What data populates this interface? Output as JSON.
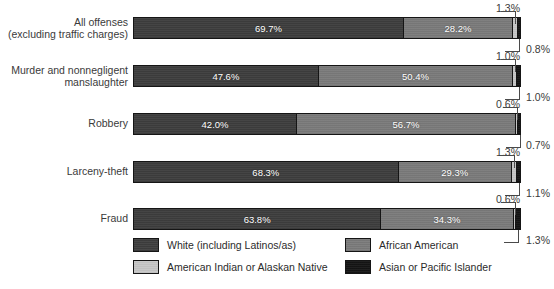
{
  "chart_data": {
    "type": "bar",
    "orientation": "horizontal",
    "stacked": true,
    "normalized_percent": true,
    "title": "",
    "subtitle": "",
    "xlabel": "",
    "ylabel": "",
    "xlim": [
      0,
      100
    ],
    "grid": false,
    "legend_position": "bottom",
    "categories": [
      "All offenses\n(excluding traffic charges)",
      "Murder and nonnegligent\nmanslaughter",
      "Robbery",
      "Larceny-theft",
      "Fraud"
    ],
    "series": [
      {
        "name": "White (including Latinos/as)",
        "color": "#3d3d3d",
        "values": [
          69.7,
          47.6,
          42.0,
          68.3,
          63.8
        ]
      },
      {
        "name": "African American",
        "color": "#7a7a7a",
        "values": [
          28.2,
          50.4,
          56.7,
          29.3,
          34.3
        ]
      },
      {
        "name": "American Indian or Alaskan Native",
        "color": "#c6c6c6",
        "values": [
          1.3,
          1.0,
          0.6,
          1.3,
          0.6
        ]
      },
      {
        "name": "Asian or Pacific Islander",
        "color": "#141414",
        "values": [
          0.8,
          1.0,
          0.7,
          1.1,
          1.3
        ]
      }
    ],
    "value_labels": [
      {
        "white": "69.7%",
        "african_american": "28.2%",
        "american_indian": "1.3%",
        "asian_pacific": "0.8%"
      },
      {
        "white": "47.6%",
        "african_american": "50.4%",
        "american_indian": "1.0%",
        "asian_pacific": "1.0%"
      },
      {
        "white": "42.0%",
        "african_american": "56.7%",
        "american_indian": "0.6%",
        "asian_pacific": "0.7%"
      },
      {
        "white": "68.3%",
        "african_american": "29.3%",
        "american_indian": "1.3%",
        "asian_pacific": "1.1%"
      },
      {
        "white": "63.8%",
        "african_american": "34.3%",
        "american_indian": "0.6%",
        "asian_pacific": "1.3%"
      }
    ]
  },
  "rows": [
    {
      "label": "All offenses\n(excluding traffic charges)",
      "segments": [
        {
          "label": "69.7%",
          "pct": 69.7
        },
        {
          "label": "28.2%",
          "pct": 28.2
        },
        {
          "label": "1.3%",
          "pct": 1.3
        },
        {
          "label": "0.8%",
          "pct": 0.8
        }
      ],
      "callout_top": "1.3%",
      "callout_bottom": "0.8%"
    },
    {
      "label": "Murder and nonnegligent\nmanslaughter",
      "segments": [
        {
          "label": "47.6%",
          "pct": 47.6
        },
        {
          "label": "50.4%",
          "pct": 50.4
        },
        {
          "label": "1.0%",
          "pct": 1.0
        },
        {
          "label": "1.0%",
          "pct": 1.0
        }
      ],
      "callout_top": "1.0%",
      "callout_bottom": "1.0%"
    },
    {
      "label": "Robbery",
      "segments": [
        {
          "label": "42.0%",
          "pct": 42.0
        },
        {
          "label": "56.7%",
          "pct": 56.7
        },
        {
          "label": "0.6%",
          "pct": 0.6
        },
        {
          "label": "0.7%",
          "pct": 0.7
        }
      ],
      "callout_top": "0.6%",
      "callout_bottom": "0.7%"
    },
    {
      "label": "Larceny-theft",
      "segments": [
        {
          "label": "68.3%",
          "pct": 68.3
        },
        {
          "label": "29.3%",
          "pct": 29.3
        },
        {
          "label": "1.3%",
          "pct": 1.3
        },
        {
          "label": "1.1%",
          "pct": 1.1
        }
      ],
      "callout_top": "1.3%",
      "callout_bottom": "1.1%"
    },
    {
      "label": "Fraud",
      "segments": [
        {
          "label": "63.8%",
          "pct": 63.8
        },
        {
          "label": "34.3%",
          "pct": 34.3
        },
        {
          "label": "0.6%",
          "pct": 0.6
        },
        {
          "label": "1.3%",
          "pct": 1.3
        }
      ],
      "callout_top": "0.6%",
      "callout_bottom": "1.3%"
    }
  ],
  "legend": {
    "items": [
      {
        "label": "White (including Latinos/as)",
        "color": "#3d3d3d",
        "swatch_class": "c0"
      },
      {
        "label": "African American",
        "color": "#7a7a7a",
        "swatch_class": "c1"
      },
      {
        "label": "American Indian or Alaskan Native",
        "color": "#c6c6c6",
        "swatch_class": "c2"
      },
      {
        "label": "Asian or Pacific Islander",
        "color": "#141414",
        "swatch_class": "c3"
      }
    ]
  },
  "colors": {
    "white_series": "#3d3d3d",
    "african_american_series": "#7a7a7a",
    "american_indian_series": "#c6c6c6",
    "asian_pacific_series": "#141414",
    "text": "#2b2b2b",
    "background": "#ffffff"
  }
}
